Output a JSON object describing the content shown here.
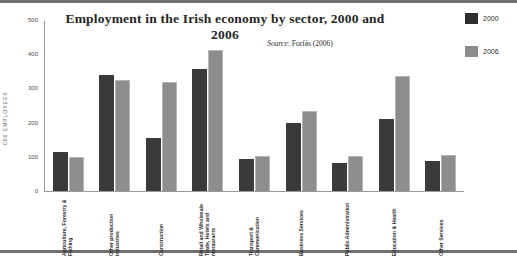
{
  "chart_data": {
    "type": "bar",
    "title": "Employment in the Irish economy by sector, 2000 and 2006",
    "source_prefix": "Source",
    "source_text": ": Forfás (2006)",
    "xlabel": "",
    "ylabel": "000 EMPLOYEES",
    "ylim": [
      0,
      500
    ],
    "yticks": [
      0,
      100,
      200,
      300,
      400,
      500
    ],
    "ytick_labels": [
      "0",
      "100",
      "200",
      "300",
      "400",
      "500"
    ],
    "grid": false,
    "legend_position": "right",
    "categories": [
      "Agriculture, Forestry & Fishing",
      "Other production industries",
      "Construction",
      "Retail and Wholesale Trade, Hotels and restaurants",
      "Transport & Communication",
      "Business Services",
      "Public Administration",
      "Education & Health",
      "Other Services"
    ],
    "series": [
      {
        "name": "2000",
        "color": "#3a3a3c",
        "values": [
          115,
          340,
          155,
          358,
          95,
          198,
          83,
          210,
          88
        ]
      },
      {
        "name": "2006",
        "color": "#8d8d8f",
        "values": [
          100,
          325,
          318,
          412,
          102,
          235,
          103,
          335,
          105
        ]
      }
    ]
  }
}
